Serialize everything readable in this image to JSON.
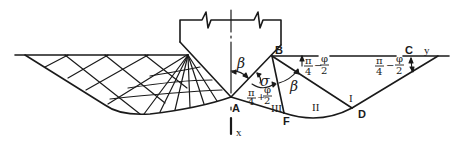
{
  "diagram": {
    "title": "",
    "points": {
      "A": "A",
      "B": "B",
      "C": "C",
      "D": "D",
      "F": "F"
    },
    "zones": {
      "I": "I",
      "II": "II",
      "III": "III"
    },
    "angles": {
      "beta": "β",
      "sigma": "σ",
      "pi": "π",
      "four": "4",
      "phi": "φ",
      "two": "2",
      "minus": "−",
      "plus": "+"
    },
    "axes": {
      "x": "x",
      "y": "y"
    },
    "colors": {
      "stroke": "#1a1a1a",
      "background": "#ffffff"
    }
  }
}
